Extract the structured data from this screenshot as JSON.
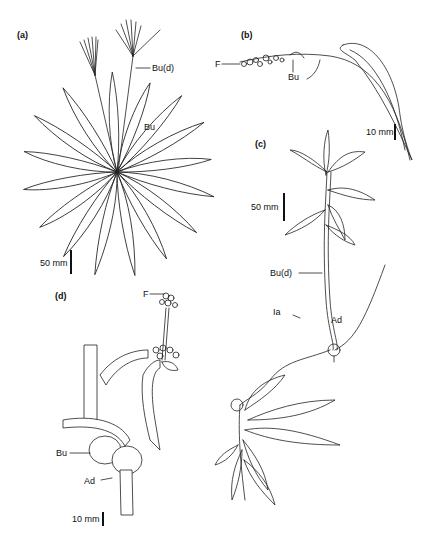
{
  "figure": {
    "panels": [
      {
        "id": "a",
        "label": "(a)",
        "annotations": [
          "Bu(d)",
          "Bu"
        ],
        "scale_bar": "50 mm"
      },
      {
        "id": "b",
        "label": "(b)",
        "annotations": [
          "F",
          "Bu"
        ],
        "scale_bar": "10 mm"
      },
      {
        "id": "c",
        "label": "(c)",
        "annotations": [
          "Bu(d)",
          "Ia",
          "Ad"
        ],
        "scale_bar": "50 mm"
      },
      {
        "id": "d",
        "label": "(d)",
        "annotations": [
          "F",
          "Bu",
          "Ad"
        ],
        "scale_bar": "10 mm"
      }
    ],
    "colors": {
      "ink": "#222222",
      "background": "#ffffff"
    }
  }
}
